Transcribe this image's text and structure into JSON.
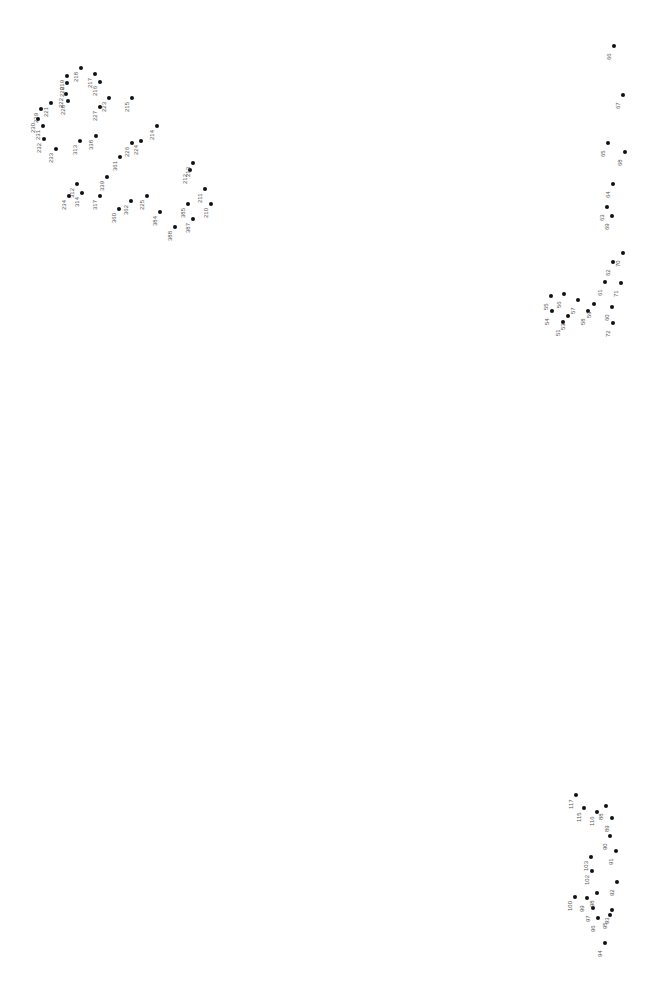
{
  "puzzle": {
    "title": "",
    "dots": [
      {
        "n": "66",
        "x": 614,
        "y": 46
      },
      {
        "n": "67",
        "x": 623,
        "y": 95
      },
      {
        "n": "65",
        "x": 608,
        "y": 143
      },
      {
        "n": "68",
        "x": 625,
        "y": 152
      },
      {
        "n": "64",
        "x": 613,
        "y": 184
      },
      {
        "n": "63",
        "x": 607,
        "y": 207
      },
      {
        "n": "69",
        "x": 612,
        "y": 216
      },
      {
        "n": "62",
        "x": 613,
        "y": 262
      },
      {
        "n": "70",
        "x": 623,
        "y": 253
      },
      {
        "n": "61",
        "x": 605,
        "y": 282
      },
      {
        "n": "71",
        "x": 621,
        "y": 283
      },
      {
        "n": "55",
        "x": 551,
        "y": 296
      },
      {
        "n": "56",
        "x": 564,
        "y": 294
      },
      {
        "n": "57",
        "x": 578,
        "y": 300
      },
      {
        "n": "54",
        "x": 552,
        "y": 311
      },
      {
        "n": "53",
        "x": 568,
        "y": 316
      },
      {
        "n": "58",
        "x": 588,
        "y": 311
      },
      {
        "n": "59",
        "x": 594,
        "y": 304
      },
      {
        "n": "60",
        "x": 612,
        "y": 307
      },
      {
        "n": "51",
        "x": 563,
        "y": 322
      },
      {
        "n": "72",
        "x": 613,
        "y": 323
      },
      {
        "n": "218",
        "x": 81,
        "y": 68
      },
      {
        "n": "217",
        "x": 95,
        "y": 74
      },
      {
        "n": "219",
        "x": 67,
        "y": 76
      },
      {
        "n": "220",
        "x": 67,
        "y": 83
      },
      {
        "n": "216",
        "x": 100,
        "y": 82
      },
      {
        "n": "221",
        "x": 51,
        "y": 103
      },
      {
        "n": "222",
        "x": 66,
        "y": 94
      },
      {
        "n": "223",
        "x": 109,
        "y": 98
      },
      {
        "n": "215",
        "x": 132,
        "y": 98
      },
      {
        "n": "229",
        "x": 41,
        "y": 109
      },
      {
        "n": "228",
        "x": 68,
        "y": 101
      },
      {
        "n": "227",
        "x": 100,
        "y": 107
      },
      {
        "n": "230",
        "x": 38,
        "y": 119
      },
      {
        "n": "231",
        "x": 43,
        "y": 126
      },
      {
        "n": "214",
        "x": 157,
        "y": 126
      },
      {
        "n": "232",
        "x": 44,
        "y": 139
      },
      {
        "n": "313",
        "x": 80,
        "y": 141
      },
      {
        "n": "338",
        "x": 96,
        "y": 136
      },
      {
        "n": "233",
        "x": 56,
        "y": 149
      },
      {
        "n": "226",
        "x": 132,
        "y": 143
      },
      {
        "n": "224",
        "x": 141,
        "y": 141
      },
      {
        "n": "361",
        "x": 120,
        "y": 157
      },
      {
        "n": "339",
        "x": 107,
        "y": 177
      },
      {
        "n": "312",
        "x": 77,
        "y": 184
      },
      {
        "n": "234",
        "x": 69,
        "y": 196
      },
      {
        "n": "314",
        "x": 82,
        "y": 193
      },
      {
        "n": "317",
        "x": 100,
        "y": 196
      },
      {
        "n": "360",
        "x": 119,
        "y": 209
      },
      {
        "n": "362",
        "x": 131,
        "y": 201
      },
      {
        "n": "225",
        "x": 147,
        "y": 196
      },
      {
        "n": "384",
        "x": 160,
        "y": 212
      },
      {
        "n": "212",
        "x": 190,
        "y": 170
      },
      {
        "n": "213",
        "x": 193,
        "y": 163
      },
      {
        "n": "385",
        "x": 188,
        "y": 204
      },
      {
        "n": "211",
        "x": 205,
        "y": 189
      },
      {
        "n": "210",
        "x": 211,
        "y": 204
      },
      {
        "n": "387",
        "x": 193,
        "y": 219
      },
      {
        "n": "388",
        "x": 175,
        "y": 227
      },
      {
        "n": "94",
        "x": 605,
        "y": 943
      },
      {
        "n": "95",
        "x": 610,
        "y": 915
      },
      {
        "n": "93",
        "x": 612,
        "y": 910
      },
      {
        "n": "96",
        "x": 598,
        "y": 918
      },
      {
        "n": "97",
        "x": 593,
        "y": 908
      },
      {
        "n": "92",
        "x": 617,
        "y": 882
      },
      {
        "n": "98",
        "x": 597,
        "y": 893
      },
      {
        "n": "99",
        "x": 587,
        "y": 898
      },
      {
        "n": "100",
        "x": 575,
        "y": 897
      },
      {
        "n": "102",
        "x": 592,
        "y": 871
      },
      {
        "n": "103",
        "x": 591,
        "y": 857
      },
      {
        "n": "91",
        "x": 616,
        "y": 851
      },
      {
        "n": "90",
        "x": 610,
        "y": 836
      },
      {
        "n": "89",
        "x": 612,
        "y": 818
      },
      {
        "n": "88",
        "x": 606,
        "y": 806
      },
      {
        "n": "116",
        "x": 597,
        "y": 812
      },
      {
        "n": "115",
        "x": 584,
        "y": 808
      },
      {
        "n": "117",
        "x": 576,
        "y": 795
      }
    ]
  }
}
